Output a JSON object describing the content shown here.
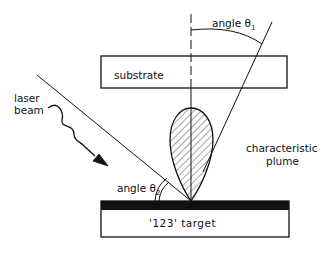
{
  "diagram": {
    "labels": {
      "angle1": "angle θ",
      "angle1_sub": "1",
      "angle2": "angle θ",
      "angle2_sub": "2",
      "substrate": "substrate",
      "laser_line1": "laser",
      "laser_line2": "beam",
      "plume_line1": "characteristic",
      "plume_line2": "plume",
      "target": "'123' target"
    },
    "colors": {
      "ink": "#111111",
      "background": "#ffffff"
    }
  }
}
